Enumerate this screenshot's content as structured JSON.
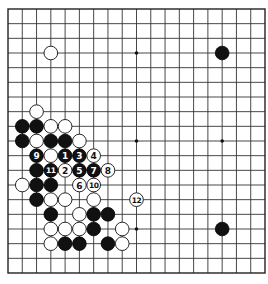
{
  "diagram": {
    "type": "go-board",
    "board_size": 19,
    "colors": {
      "background": "#ffffff",
      "line": "#333333",
      "black": "#111111",
      "white": "#ffffff"
    },
    "hoshi": [
      [
        3,
        3
      ],
      [
        9,
        3
      ],
      [
        15,
        3
      ],
      [
        3,
        9
      ],
      [
        9,
        9
      ],
      [
        15,
        9
      ],
      [
        3,
        15
      ],
      [
        9,
        15
      ],
      [
        15,
        15
      ]
    ],
    "stones": [
      {
        "c": 3,
        "r": 3,
        "color": "white"
      },
      {
        "c": 15,
        "r": 3,
        "color": "black"
      },
      {
        "c": 2,
        "r": 7,
        "color": "white"
      },
      {
        "c": 1,
        "r": 8,
        "color": "black"
      },
      {
        "c": 2,
        "r": 8,
        "color": "black"
      },
      {
        "c": 3,
        "r": 8,
        "color": "white"
      },
      {
        "c": 4,
        "r": 8,
        "color": "white"
      },
      {
        "c": 1,
        "r": 9,
        "color": "black"
      },
      {
        "c": 2,
        "r": 9,
        "color": "white"
      },
      {
        "c": 3,
        "r": 9,
        "color": "black"
      },
      {
        "c": 4,
        "r": 9,
        "color": "black"
      },
      {
        "c": 5,
        "r": 9,
        "color": "white"
      },
      {
        "c": 2,
        "r": 10,
        "color": "black",
        "label": "9"
      },
      {
        "c": 3,
        "r": 10,
        "color": "white"
      },
      {
        "c": 4,
        "r": 10,
        "color": "black",
        "label": "1"
      },
      {
        "c": 5,
        "r": 10,
        "color": "black",
        "label": "3"
      },
      {
        "c": 6,
        "r": 10,
        "color": "white",
        "label": "4"
      },
      {
        "c": 2,
        "r": 11,
        "color": "black"
      },
      {
        "c": 3,
        "r": 11,
        "color": "black",
        "label": "11"
      },
      {
        "c": 4,
        "r": 11,
        "color": "white",
        "label": "2"
      },
      {
        "c": 5,
        "r": 11,
        "color": "black",
        "label": "5"
      },
      {
        "c": 6,
        "r": 11,
        "color": "black",
        "label": "7"
      },
      {
        "c": 7,
        "r": 11,
        "color": "white",
        "label": "8"
      },
      {
        "c": 1,
        "r": 12,
        "color": "white"
      },
      {
        "c": 2,
        "r": 12,
        "color": "black"
      },
      {
        "c": 3,
        "r": 12,
        "color": "black"
      },
      {
        "c": 5,
        "r": 12,
        "color": "white",
        "label": "6"
      },
      {
        "c": 6,
        "r": 12,
        "color": "white",
        "label": "10"
      },
      {
        "c": 2,
        "r": 13,
        "color": "black"
      },
      {
        "c": 3,
        "r": 13,
        "color": "white"
      },
      {
        "c": 4,
        "r": 13,
        "color": "white"
      },
      {
        "c": 6,
        "r": 13,
        "color": "white"
      },
      {
        "c": 9,
        "r": 13,
        "color": "white",
        "label": "12"
      },
      {
        "c": 3,
        "r": 14,
        "color": "black"
      },
      {
        "c": 5,
        "r": 14,
        "color": "white"
      },
      {
        "c": 6,
        "r": 14,
        "color": "black"
      },
      {
        "c": 7,
        "r": 14,
        "color": "black"
      },
      {
        "c": 3,
        "r": 15,
        "color": "white"
      },
      {
        "c": 4,
        "r": 15,
        "color": "white"
      },
      {
        "c": 5,
        "r": 15,
        "color": "white"
      },
      {
        "c": 6,
        "r": 15,
        "color": "black"
      },
      {
        "c": 8,
        "r": 15,
        "color": "white"
      },
      {
        "c": 15,
        "r": 15,
        "color": "black"
      },
      {
        "c": 3,
        "r": 16,
        "color": "white"
      },
      {
        "c": 4,
        "r": 16,
        "color": "black"
      },
      {
        "c": 5,
        "r": 16,
        "color": "black"
      },
      {
        "c": 7,
        "r": 16,
        "color": "black"
      },
      {
        "c": 8,
        "r": 16,
        "color": "white"
      }
    ]
  }
}
